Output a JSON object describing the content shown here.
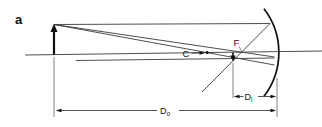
{
  "figure_type": "optics-ray-diagram-concave-mirror",
  "colors": {
    "background": "#ffffff",
    "ink": "#101010",
    "line": "#3a3a3a"
  },
  "panel": {
    "label": "a"
  },
  "points": {
    "center_of_curvature_label": "C",
    "focal_point_label": "F"
  },
  "dimensions": {
    "image_distance": {
      "base": "D",
      "sub": "i"
    },
    "object_distance": {
      "base": "D",
      "sub": "o"
    }
  }
}
